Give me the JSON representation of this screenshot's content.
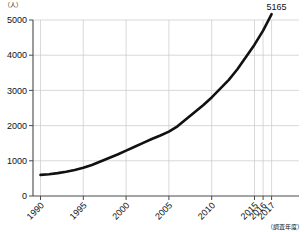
{
  "chart_data": {
    "type": "line",
    "title": "",
    "subtitle": "",
    "xlabel": "（調査年度）",
    "ylabel": "（人）",
    "unit_label": "（人）",
    "xaxis_caption": "（調査年度）",
    "grid": true,
    "legend": "none",
    "ylim": [
      0,
      5000
    ],
    "ytick_labels": [
      "0",
      "1000",
      "2000",
      "3000",
      "4000",
      "5000"
    ],
    "ytick_values": [
      0,
      1000,
      2000,
      3000,
      4000,
      5000
    ],
    "xtick_labels": [
      "1990",
      "1995",
      "2000",
      "2005",
      "2010",
      "2015",
      "2016",
      "2017"
    ],
    "xtick_values": [
      1990,
      1995,
      2000,
      2005,
      2010,
      2015,
      2016,
      2017
    ],
    "x": [
      1990,
      1991,
      1992,
      1993,
      1994,
      1995,
      1996,
      1997,
      1998,
      1999,
      2000,
      2001,
      2002,
      2003,
      2004,
      2005,
      2006,
      2007,
      2008,
      2009,
      2010,
      2011,
      2012,
      2013,
      2014,
      2015,
      2016,
      2017
    ],
    "values": [
      600,
      620,
      650,
      690,
      740,
      800,
      880,
      980,
      1080,
      1180,
      1290,
      1400,
      1510,
      1620,
      1720,
      1830,
      1980,
      2180,
      2380,
      2580,
      2800,
      3050,
      3300,
      3600,
      3950,
      4300,
      4700,
      5165
    ],
    "series": [
      {
        "name": "count",
        "values": [
          600,
          620,
          650,
          690,
          740,
          800,
          880,
          980,
          1080,
          1180,
          1290,
          1400,
          1510,
          1620,
          1720,
          1830,
          1980,
          2180,
          2380,
          2580,
          2800,
          3050,
          3300,
          3600,
          3950,
          4300,
          4700,
          5165
        ]
      }
    ],
    "annotations": [
      {
        "label": "5165",
        "x": 2017,
        "y": 5165
      }
    ],
    "colors": {
      "line": "#111111",
      "grid": "#c9c9c9",
      "axis": "#4a4a4a",
      "text": "#111111",
      "background": "#ffffff"
    }
  }
}
